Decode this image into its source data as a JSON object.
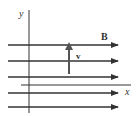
{
  "diagram": {
    "labels": {
      "y_axis": "y",
      "x_axis": "x",
      "field": "B",
      "velocity": "v"
    },
    "field_lines": {
      "count": 5,
      "direction": "right",
      "y_positions": [
        45,
        61,
        77,
        93,
        107
      ]
    },
    "velocity_vector": {
      "direction": "up"
    },
    "colors": {
      "line": "#333333",
      "velocity_arrow": "#555555",
      "background": "#ffffff"
    }
  }
}
